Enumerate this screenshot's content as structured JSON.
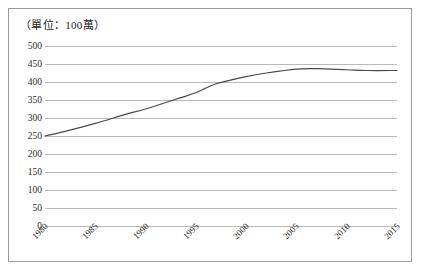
{
  "chart_data": {
    "type": "line",
    "title": "（單位：100萬）",
    "xlabel": "",
    "ylabel": "",
    "ylim": [
      0,
      500
    ],
    "ytick_step": 50,
    "yticks": [
      500,
      450,
      400,
      350,
      300,
      250,
      200,
      150,
      100,
      50,
      0
    ],
    "grid": true,
    "legend": "none",
    "categories": [
      1980,
      1985,
      1990,
      1995,
      2000,
      2005,
      2010,
      2015
    ],
    "xtick_labels": [
      "1980",
      "1985",
      "1990",
      "1995",
      "2000",
      "2005",
      "2010",
      "2015"
    ],
    "series": [
      {
        "name": "value",
        "x": [
          1980,
          1982,
          1985,
          1988,
          1990,
          1993,
          1995,
          1997,
          2000,
          2002,
          2005,
          2007,
          2010,
          2012,
          2015
        ],
        "values": [
          250,
          263,
          285,
          310,
          325,
          352,
          370,
          395,
          415,
          425,
          436,
          437,
          434,
          432,
          432
        ]
      }
    ],
    "colors": {
      "line": "#4a4a4a",
      "gridline": "#b9b9b9",
      "border": "#9a9a9a",
      "text": "#2b2b2b"
    }
  }
}
